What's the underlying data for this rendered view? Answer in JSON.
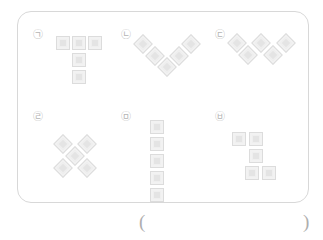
{
  "page": {
    "type": "worksheet-question",
    "background_color": "#ffffff",
    "border_color": "#d8d8d8",
    "tile_color": "#f2f2f2",
    "tile_inner_color": "#e4e4e4",
    "label_color": "#b4b4b4"
  },
  "problem_box": {
    "items": [
      {
        "label": "㉠",
        "label_name": "circled-giyeok",
        "shape_name": "t-pentomino",
        "orientation": "upright",
        "tile_count": 5,
        "cells": [
          [
            0,
            0
          ],
          [
            1,
            0
          ],
          [
            2,
            0
          ],
          [
            1,
            1
          ],
          [
            1,
            2
          ]
        ]
      },
      {
        "label": "㉡",
        "label_name": "circled-nieun",
        "shape_name": "v-pentomino-rotated",
        "orientation": "diamond-45deg",
        "tile_count": 5,
        "cells": [
          [
            0,
            0
          ],
          [
            1,
            1
          ],
          [
            2,
            2
          ],
          [
            3,
            1
          ],
          [
            4,
            0
          ]
        ]
      },
      {
        "label": "㉢",
        "label_name": "circled-digeut",
        "shape_name": "w-zigzag-pentomino-rotated",
        "orientation": "diamond-45deg",
        "tile_count": 5,
        "cells": [
          [
            0,
            0
          ],
          [
            1,
            1
          ],
          [
            2,
            0
          ],
          [
            3,
            1
          ],
          [
            4,
            0
          ]
        ]
      },
      {
        "label": "㉣",
        "label_name": "circled-rieul",
        "shape_name": "x-pentomino-rotated",
        "orientation": "diamond-45deg",
        "tile_count": 5,
        "cells": [
          [
            0,
            0
          ],
          [
            2,
            0
          ],
          [
            1,
            1
          ],
          [
            0,
            2
          ],
          [
            2,
            2
          ]
        ]
      },
      {
        "label": "㉤",
        "label_name": "circled-mieum",
        "shape_name": "i-pentomino",
        "orientation": "vertical",
        "tile_count": 5,
        "cells": [
          [
            0,
            0
          ],
          [
            0,
            1
          ],
          [
            0,
            2
          ],
          [
            0,
            3
          ],
          [
            0,
            4
          ]
        ]
      },
      {
        "label": "㉥",
        "label_name": "circled-bieup",
        "shape_name": "s-pentomino",
        "orientation": "upright",
        "tile_count": 5,
        "cells": [
          [
            0,
            0
          ],
          [
            1,
            0
          ],
          [
            1,
            1
          ],
          [
            0,
            2
          ],
          [
            1,
            2
          ]
        ]
      }
    ]
  },
  "answer": {
    "paren_open": "(",
    "paren_close": ")",
    "value": ""
  }
}
